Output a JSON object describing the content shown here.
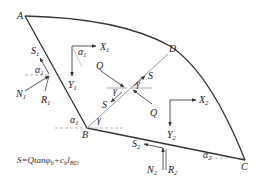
{
  "diagram": {
    "type": "slope-wedge force diagram",
    "colors": {
      "outline": "#333333",
      "force": "#444444",
      "dashed": "#888888",
      "divider": "#aaaaaa"
    },
    "points": {
      "A": {
        "label": "A"
      },
      "B": {
        "label": "B"
      },
      "C": {
        "label": "C"
      },
      "D": {
        "label": "D"
      }
    },
    "block1": {
      "forces": {
        "S1": "S",
        "S1_sub": "1",
        "N1": "N",
        "N1_sub": "1",
        "R1": "R",
        "R1_sub": "1"
      },
      "axes": {
        "X1": "X",
        "X1_sub": "1",
        "Y1": "Y",
        "Y1_sub": "1"
      },
      "angles": {
        "alpha1_left": "α",
        "alpha1_left_sub": "1",
        "alpha1_axes": "α",
        "alpha1_axes_sub": "1",
        "alpha1_B": "α",
        "alpha1_B_sub": "1"
      }
    },
    "block2": {
      "forces": {
        "S2": "S",
        "S2_sub": "2",
        "N2": "N",
        "N2_sub": "2",
        "R2": "R",
        "R2_sub": "2"
      },
      "axes": {
        "X2": "X",
        "X2_sub": "2",
        "Y2": "Y",
        "Y2_sub": "2"
      },
      "angles": {
        "alpha2": "α",
        "alpha2_sub": "2"
      }
    },
    "interface": {
      "forces": {
        "Q_left": "Q",
        "Q_right": "Q",
        "S_upper": "S",
        "S_lower": "S"
      },
      "angles": {
        "gamma_B": "γ",
        "gamma_left": "γ",
        "gamma_right": "γ"
      }
    },
    "formula": {
      "lhs": "S=Qtanφ",
      "phi_sub": "b",
      "plus": "+c",
      "c_sub": "b",
      "l": "l",
      "l_sub": "BD"
    }
  }
}
